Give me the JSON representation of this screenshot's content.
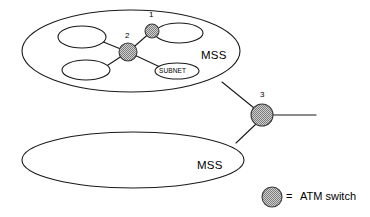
{
  "figure": {
    "type": "network-topology-diagram",
    "background_color": "#ffffff",
    "line_color": "#1a1a1a",
    "switch_fill_color": "#a8a8a8",
    "switch_stroke_color": "#444444"
  },
  "regions": [
    {
      "id": "mss-upper",
      "label": "MSS",
      "label_x": 201,
      "label_y": 56,
      "cx": 131,
      "cy": 51,
      "rx": 109,
      "ry": 41
    },
    {
      "id": "mss-lower",
      "label": "MSS",
      "label_x": 197,
      "label_y": 166,
      "cx": 133,
      "cy": 160,
      "rx": 111,
      "ry": 28
    }
  ],
  "subnets": [
    {
      "id": "subnet-upper-left",
      "label": "",
      "cx": 82,
      "cy": 37,
      "rx": 24,
      "ry": 11
    },
    {
      "id": "subnet-lower-left",
      "label": "",
      "cx": 86,
      "cy": 70,
      "rx": 24,
      "ry": 10
    },
    {
      "id": "subnet-upper-right",
      "label": "",
      "cx": 179,
      "cy": 33,
      "rx": 24,
      "ry": 10
    },
    {
      "id": "subnet-labeled",
      "label": "SUBNET",
      "cx": 177,
      "cy": 71,
      "rx": 22,
      "ry": 8
    }
  ],
  "switches": [
    {
      "id": "switch-1",
      "number": "1",
      "cx": 152,
      "cy": 31,
      "r": 7,
      "label_x": 149,
      "label_y": 15
    },
    {
      "id": "switch-2",
      "number": "2",
      "cx": 128,
      "cy": 52,
      "r": 9,
      "label_x": 125,
      "label_y": 36
    },
    {
      "id": "switch-3",
      "number": "3",
      "cx": 262,
      "cy": 115,
      "r": 11,
      "label_x": 260,
      "label_y": 95
    }
  ],
  "links": [
    {
      "id": "link-s2-upper-left-subnet",
      "x1": 128,
      "y1": 52,
      "x2": 101,
      "y2": 41
    },
    {
      "id": "link-s2-lower-left-subnet",
      "x1": 128,
      "y1": 52,
      "x2": 105,
      "y2": 67
    },
    {
      "id": "link-s2-s1",
      "x1": 128,
      "y1": 52,
      "x2": 152,
      "y2": 31
    },
    {
      "id": "link-s2-subnet-label",
      "x1": 128,
      "y1": 52,
      "x2": 160,
      "y2": 67
    },
    {
      "id": "link-s1-upper-right-subnet",
      "x1": 152,
      "y1": 31,
      "x2": 165,
      "y2": 34
    },
    {
      "id": "link-mss-upper-to-s3",
      "x1": 222,
      "y1": 82,
      "x2": 254,
      "y2": 108
    },
    {
      "id": "link-mss-lower-to-s3",
      "x1": 236,
      "y1": 143,
      "x2": 256,
      "y2": 124
    },
    {
      "id": "link-s3-external",
      "x1": 273,
      "y1": 115,
      "x2": 315,
      "y2": 115
    }
  ],
  "legend": {
    "id": "legend-atm-switch",
    "marker_cx": 272,
    "marker_cy": 197,
    "marker_r": 10,
    "equals_sign": "=",
    "equals_x": 286,
    "equals_y": 202,
    "text": "ATM switch",
    "text_x": 300,
    "text_y": 202
  }
}
